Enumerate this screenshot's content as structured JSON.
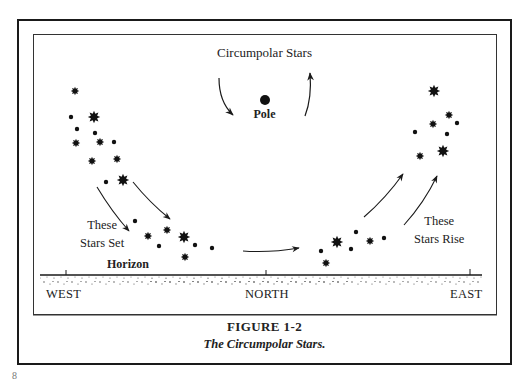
{
  "diagram": {
    "heading": "Circumpolar Stars",
    "pole_label": "Pole",
    "left_label": [
      "These",
      "Stars Set"
    ],
    "right_label": [
      "These",
      "Stars Rise"
    ],
    "horizon_label": "Horizon",
    "directions": {
      "west": "WEST",
      "north": "NORTH",
      "east": "EAST"
    },
    "stars": [
      {
        "x": 75,
        "y": 91,
        "size": "m"
      },
      {
        "x": 71,
        "y": 117,
        "size": "s"
      },
      {
        "x": 94,
        "y": 117,
        "size": "l"
      },
      {
        "x": 77,
        "y": 129,
        "size": "s"
      },
      {
        "x": 95,
        "y": 133,
        "size": "s"
      },
      {
        "x": 76,
        "y": 143,
        "size": "m"
      },
      {
        "x": 100,
        "y": 142,
        "size": "m"
      },
      {
        "x": 114,
        "y": 142,
        "size": "s"
      },
      {
        "x": 92,
        "y": 161,
        "size": "m"
      },
      {
        "x": 117,
        "y": 159,
        "size": "m"
      },
      {
        "x": 106,
        "y": 182,
        "size": "s"
      },
      {
        "x": 123,
        "y": 180,
        "size": "l"
      },
      {
        "x": 135,
        "y": 221,
        "size": "s"
      },
      {
        "x": 148,
        "y": 236,
        "size": "m"
      },
      {
        "x": 167,
        "y": 230,
        "size": "m"
      },
      {
        "x": 184,
        "y": 237,
        "size": "l"
      },
      {
        "x": 159,
        "y": 246,
        "size": "s"
      },
      {
        "x": 195,
        "y": 245,
        "size": "s"
      },
      {
        "x": 212,
        "y": 248,
        "size": "s"
      },
      {
        "x": 185,
        "y": 257,
        "size": "m"
      },
      {
        "x": 356,
        "y": 232,
        "size": "s"
      },
      {
        "x": 337,
        "y": 242,
        "size": "l"
      },
      {
        "x": 370,
        "y": 241,
        "size": "m"
      },
      {
        "x": 384,
        "y": 238,
        "size": "s"
      },
      {
        "x": 351,
        "y": 249,
        "size": "s"
      },
      {
        "x": 321,
        "y": 251,
        "size": "s"
      },
      {
        "x": 326,
        "y": 263,
        "size": "m"
      },
      {
        "x": 434,
        "y": 91,
        "size": "l"
      },
      {
        "x": 449,
        "y": 115,
        "size": "m"
      },
      {
        "x": 433,
        "y": 124,
        "size": "m"
      },
      {
        "x": 457,
        "y": 123,
        "size": "s"
      },
      {
        "x": 415,
        "y": 132,
        "size": "s"
      },
      {
        "x": 447,
        "y": 134,
        "size": "s"
      },
      {
        "x": 443,
        "y": 151,
        "size": "l"
      },
      {
        "x": 420,
        "y": 156,
        "size": "m"
      }
    ],
    "colors": {
      "ink": "#1a1a1a",
      "paper": "#ffffff"
    }
  },
  "caption": {
    "figure_number": "FIGURE 1-2",
    "title": "The Circumpolar Stars."
  },
  "page_number": "8"
}
